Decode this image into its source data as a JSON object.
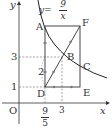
{
  "diagram": {
    "axes": {
      "x_label": "x",
      "y_label": "y",
      "origin_label": "O"
    },
    "curve": {
      "equation_lhs": "y=",
      "numerator": "9",
      "denominator": "x"
    },
    "points": {
      "A": "A",
      "B": "B",
      "C": "C",
      "D": "D",
      "E": "E",
      "F": "F"
    },
    "y_ticks": {
      "one": "1",
      "three": "3"
    },
    "x_ticks": {
      "nine_fifths_num": "9",
      "nine_fifths_den": "5",
      "three": "3"
    },
    "segment_label": "2",
    "colors": {
      "line": "#333333",
      "dashed": "#666666",
      "dot": "#777777"
    }
  }
}
